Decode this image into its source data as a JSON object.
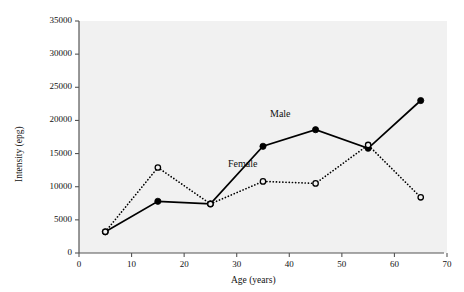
{
  "chart_data": {
    "type": "line",
    "title": "",
    "xlabel": "Age (years)",
    "ylabel": "Intensity (epg)",
    "xlim": [
      0,
      70
    ],
    "ylim": [
      0,
      35000
    ],
    "xticks": [
      0,
      10,
      20,
      30,
      40,
      50,
      60,
      70
    ],
    "yticks": [
      0,
      5000,
      10000,
      15000,
      20000,
      25000,
      30000,
      35000
    ],
    "xtick_labels": [
      "0",
      "10",
      "20",
      "30",
      "40",
      "50",
      "60",
      "70"
    ],
    "ytick_labels": [
      "0",
      "5000",
      "10000",
      "15000",
      "20000",
      "25000",
      "30000",
      "35000"
    ],
    "grid": false,
    "legend": "inline-annotations",
    "plot_background": "#f1f1f1",
    "x": [
      5,
      15,
      25,
      35,
      45,
      55,
      65
    ],
    "series": [
      {
        "name": "Male",
        "values": [
          3200,
          7800,
          7400,
          16100,
          18600,
          15800,
          23000
        ],
        "line_style": "solid",
        "marker": "filled-circle",
        "color": "#000000",
        "label_x": 39,
        "label_y": 20800
      },
      {
        "name": "Female",
        "values": [
          3200,
          12900,
          7400,
          10800,
          10500,
          16300,
          8400
        ],
        "line_style": "dotted",
        "marker": "open-circle",
        "color": "#000000",
        "label_x": 31,
        "label_y": 13300
      }
    ],
    "annotations": [
      {
        "text": "Male",
        "x": 39,
        "y": 20800
      },
      {
        "text": "Female",
        "x": 31,
        "y": 13300
      }
    ]
  }
}
